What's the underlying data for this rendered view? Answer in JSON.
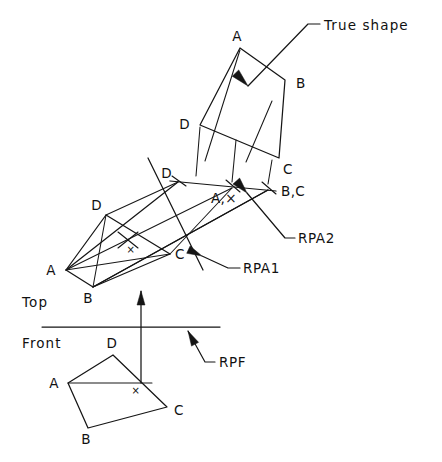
{
  "drawing": {
    "title": "Descriptive geometry: true shape of an oblique plane",
    "background_color": "#ffffff",
    "ink_color": "#151515",
    "width": 442,
    "height": 462
  },
  "labels": {
    "true_shape": "True shape",
    "top": "Top",
    "front": "Front",
    "rpa1": "RPA1",
    "rpa2": "RPA2",
    "rpf": "RPF",
    "point_mark": "×",
    "a": "A",
    "b": "B",
    "c": "C",
    "d": "D",
    "a_and_point": "A,×",
    "b_and_c": "B,C"
  },
  "views": {
    "true_shape_view": {
      "name": "True shape auxiliary view",
      "vertices": {
        "A": [
          240,
          48
        ],
        "B": [
          285,
          80
        ],
        "C": [
          279,
          158
        ],
        "D": [
          200,
          125
        ]
      },
      "labels": [
        {
          "text": "A",
          "x": 237,
          "y": 41,
          "anchor": "middle"
        },
        {
          "text": "B",
          "x": 296,
          "y": 88,
          "anchor": "start"
        },
        {
          "text": "C",
          "x": 283,
          "y": 174,
          "anchor": "start"
        },
        {
          "text": "D",
          "x": 190,
          "y": 129,
          "anchor": "end"
        }
      ]
    },
    "edge_view": {
      "name": "First auxiliary edge view",
      "line_start": [
        170,
        181
      ],
      "line_end": [
        276,
        191
      ],
      "points": {
        "D": [
          178,
          182
        ],
        "A_x": [
          232,
          188
        ],
        "B_C": [
          268,
          190
        ]
      },
      "labels": [
        {
          "text": "D",
          "x": 172,
          "y": 178,
          "anchor": "end"
        },
        {
          "text": "A,×",
          "x": 224,
          "y": 203,
          "anchor": "middle"
        },
        {
          "text": "B,C",
          "x": 281,
          "y": 196,
          "anchor": "start"
        }
      ]
    },
    "top_view": {
      "name": "Top view",
      "vertices": {
        "A": [
          66,
          270
        ],
        "B": [
          93,
          287
        ],
        "C": [
          170,
          254
        ],
        "D": [
          106,
          215
        ]
      },
      "point_x": [
        128,
        240
      ],
      "diagonal_AC": [
        [
          66,
          270
        ],
        [
          170,
          254
        ]
      ],
      "diagonal_BD": [
        [
          93,
          287
        ],
        [
          106,
          215
        ]
      ],
      "labels": [
        {
          "text": "A",
          "x": 56,
          "y": 275,
          "anchor": "end"
        },
        {
          "text": "B",
          "x": 88,
          "y": 303,
          "anchor": "middle"
        },
        {
          "text": "C",
          "x": 175,
          "y": 259,
          "anchor": "start"
        },
        {
          "text": "D",
          "x": 102,
          "y": 210,
          "anchor": "end"
        },
        {
          "text": "×",
          "x": 131,
          "y": 253,
          "anchor": "middle"
        }
      ]
    },
    "front_view": {
      "name": "Front view",
      "vertices": {
        "A": [
          68,
          383
        ],
        "B": [
          88,
          428
        ],
        "C": [
          167,
          407
        ],
        "D": [
          113,
          355
        ]
      },
      "point_x": [
        141,
        383
      ],
      "line_A_to_x": [
        [
          68,
          383
        ],
        [
          152,
          383
        ]
      ],
      "labels": [
        {
          "text": "A",
          "x": 59,
          "y": 388,
          "anchor": "end"
        },
        {
          "text": "B",
          "x": 86,
          "y": 444,
          "anchor": "middle"
        },
        {
          "text": "C",
          "x": 174,
          "y": 415,
          "anchor": "start"
        },
        {
          "text": "D",
          "x": 112,
          "y": 348,
          "anchor": "middle"
        },
        {
          "text": "×",
          "x": 136,
          "y": 394,
          "anchor": "middle"
        }
      ]
    }
  },
  "reference_planes": {
    "rpf": {
      "name": "Reference plane front",
      "line": [
        [
          42,
          327
        ],
        [
          220,
          327
        ]
      ],
      "leader": [
        [
          188,
          331
        ],
        [
          205,
          362
        ],
        [
          215,
          362
        ]
      ],
      "arrow_at": [
        188,
        331
      ],
      "arrow_angle": 62,
      "label": {
        "text": "RPF",
        "x": 219,
        "y": 367,
        "anchor": "start"
      }
    },
    "rpa1": {
      "name": "Reference plane auxiliary 1",
      "line": [
        [
          148,
          158
        ],
        [
          203,
          270
        ]
      ],
      "leader": [
        [
          202,
          256
        ],
        [
          228,
          268
        ],
        [
          240,
          268
        ]
      ],
      "arrow_at": [
        202,
        256
      ],
      "arrow_angle": 205,
      "label": {
        "text": "RPA1",
        "x": 243,
        "y": 273,
        "anchor": "start"
      }
    },
    "rpa2": {
      "name": "Reference plane auxiliary 2",
      "leader": [
        [
          247,
          193
        ],
        [
          285,
          238
        ],
        [
          295,
          238
        ]
      ],
      "arrow_at": [
        247,
        193
      ],
      "arrow_angle": 228,
      "label": {
        "text": "RPA2",
        "x": 298,
        "y": 243,
        "anchor": "start"
      }
    }
  },
  "fold_line": {
    "name": "Top/Front folding line",
    "line": [
      [
        42,
        327
      ],
      [
        220,
        327
      ]
    ],
    "top_label": {
      "text": "Top",
      "x": 22,
      "y": 307,
      "anchor": "start"
    },
    "front_label": {
      "text": "Front",
      "x": 22,
      "y": 348,
      "anchor": "start"
    }
  },
  "projection_arrow": {
    "name": "Vertical projection direction arrow",
    "line": [
      [
        141,
        383
      ],
      [
        141,
        291
      ]
    ],
    "arrow_at": [
      141,
      291
    ],
    "arrow_angle": 270
  },
  "projectors": {
    "name": "Projection lines between views",
    "to_true_shape": [
      [
        [
          196,
          176
        ],
        [
          200,
          127
        ]
      ],
      [
        [
          205,
          161
        ],
        [
          240,
          50
        ]
      ],
      [
        [
          232,
          182
        ],
        [
          236,
          140
        ]
      ],
      [
        [
          246,
          162
        ],
        [
          272,
          101
        ]
      ],
      [
        [
          268,
          184
        ],
        [
          272,
          160
        ]
      ]
    ],
    "from_top_view": [
      [
        [
          106,
          215
        ],
        [
          178,
          182
        ]
      ],
      [
        [
          170,
          254
        ],
        [
          232,
          188
        ]
      ],
      [
        [
          93,
          287
        ],
        [
          268,
          190
        ]
      ],
      [
        [
          66,
          270
        ],
        [
          232,
          188
        ]
      ]
    ],
    "edge_strip": [
      [
        [
          66,
          270
        ],
        [
          178,
          182
        ]
      ],
      [
        [
          93,
          287
        ],
        [
          268,
          190
        ]
      ]
    ],
    "tick_marks": [
      [
        [
          172,
          176
        ],
        [
          186,
          186
        ]
      ],
      [
        [
          226,
          180
        ],
        [
          240,
          192
        ]
      ],
      [
        [
          262,
          182
        ],
        [
          276,
          194
        ]
      ],
      [
        [
          118,
          232
        ],
        [
          138,
          248
        ]
      ],
      [
        [
          118,
          248
        ],
        [
          138,
          232
        ]
      ]
    ]
  },
  "annotations": {
    "true_shape_leader": {
      "name": "True shape callout",
      "leader": [
        [
          248,
          86
        ],
        [
          308,
          24
        ],
        [
          320,
          24
        ]
      ],
      "arrow_at": [
        248,
        86
      ],
      "arrow_angle": 226,
      "label": {
        "text": "True shape",
        "x": 324,
        "y": 30,
        "anchor": "start"
      }
    }
  }
}
